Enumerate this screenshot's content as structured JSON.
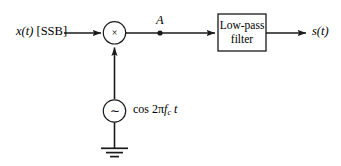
{
  "figure": {
    "type": "block-diagram",
    "background": "#ffffff",
    "stroke_color": "#1a1a1a"
  },
  "input": {
    "signal": "x(t)",
    "annotation": "[SSB]",
    "full_label": "x(t) [SSB]"
  },
  "multiplier": {
    "symbol": "×",
    "name": "product-modulator",
    "shape": "circle"
  },
  "oscillator": {
    "symbol": "∼",
    "shape": "circle",
    "label_prefix": "cos 2",
    "label_pi": "π",
    "label_f": "f",
    "label_sub": "c",
    "label_t": "t",
    "full_label": "cos 2πfₑt"
  },
  "ground": {
    "name": "ground-symbol",
    "bars": 3
  },
  "node": {
    "label": "A"
  },
  "filter": {
    "line1": "Low-pass",
    "line2": "filter",
    "full_label": "Low-pass filter"
  },
  "output": {
    "signal": "s(t)"
  }
}
